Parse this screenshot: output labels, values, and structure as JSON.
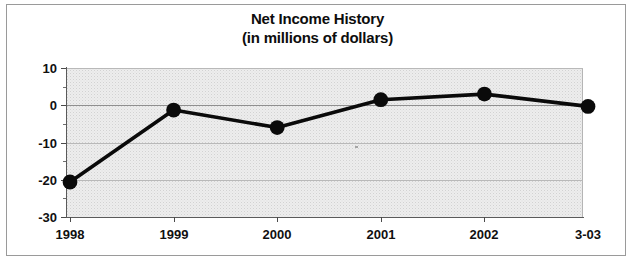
{
  "chart_data": {
    "type": "line",
    "title": "Net Income History",
    "subtitle": "(in millions of dollars)",
    "xlabel": "",
    "ylabel": "",
    "categories": [
      "1998",
      "1999",
      "2000",
      "2001",
      "2002",
      "3-03"
    ],
    "values": [
      -20.6,
      -1.3,
      -6.0,
      1.5,
      3.0,
      -0.3
    ],
    "series": [
      {
        "name": "Net Income",
        "values": [
          -20.6,
          -1.3,
          -6.0,
          1.5,
          3.0,
          -0.3
        ]
      }
    ],
    "ylim": [
      -30,
      10
    ],
    "yticks": [
      10,
      0,
      -10,
      -20,
      -30
    ],
    "ytick_labels": [
      "10",
      "0",
      "-10",
      "-20",
      "-30"
    ],
    "yminor_step": 5,
    "grid": true,
    "legend": false,
    "legend_position": "none",
    "line_color": "#0a0a0a",
    "marker_color": "#0a0a0a",
    "plot_background": "#ededed",
    "grid_color": "#b9b9b9",
    "axis_color": "#5a5a5a",
    "text_color": "#101010"
  },
  "titles": {
    "line1": "Net Income History",
    "line2": "(in millions of dollars)"
  }
}
